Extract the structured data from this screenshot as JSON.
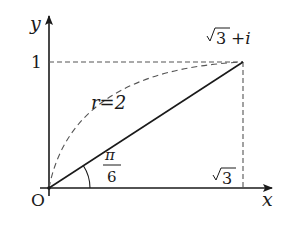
{
  "diagram": {
    "type": "complex-plane",
    "axes": {
      "x_label": "x",
      "y_label": "y",
      "origin_label": "O"
    },
    "point": {
      "label_sqrt": "3",
      "label_rest": "+i",
      "description": "√3+i"
    },
    "ticks": {
      "y_tick": "1",
      "x_tick_sqrt": "3"
    },
    "modulus_label": "r=2",
    "angle_label": {
      "numerator": "π",
      "denominator": "6"
    },
    "colors": {
      "line": "#1a1a1a",
      "dash": "#555555",
      "background": "#ffffff"
    }
  }
}
